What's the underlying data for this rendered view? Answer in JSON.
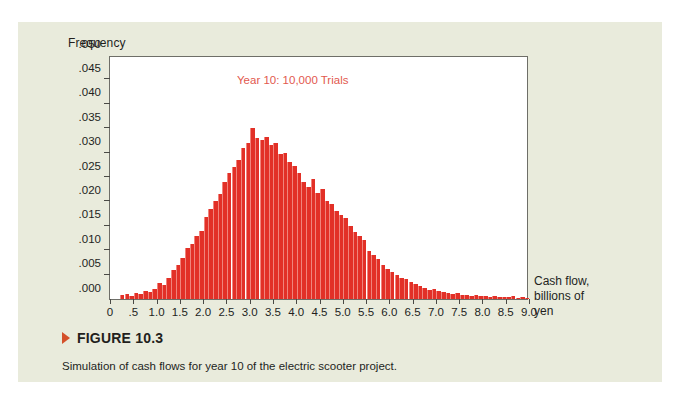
{
  "figure": {
    "marker_icon": "triangle-marker-icon",
    "number_label": "FIGURE 10.3",
    "caption": "Simulation of cash flows for year 10 of the electric scooter project."
  },
  "colors": {
    "panel_background": "#e9ebdc",
    "plot_background": "#ffffff",
    "bar": "#e23027",
    "annotation": "#e2594e",
    "marker": "#d4502a",
    "axis": "#6e6e68",
    "text": "#231f1d"
  },
  "chart_data": {
    "type": "bar",
    "title": "",
    "annotation": "Year 10: 10,000 Trials",
    "ylabel": "Frequency",
    "xlabel": "Cash flow, billions of yen",
    "xlabel_lines": [
      "Cash flow,",
      "billions of",
      "yen"
    ],
    "ylim": [
      0.0,
      0.05
    ],
    "xlim": [
      0.0,
      9.0
    ],
    "grid": false,
    "legend": "none",
    "ytick_labels": [
      ".000",
      ".005",
      ".010",
      ".015",
      ".020",
      ".025",
      ".030",
      ".035",
      ".040",
      ".045",
      ".050"
    ],
    "ytick_values": [
      0.0,
      0.005,
      0.01,
      0.015,
      0.02,
      0.025,
      0.03,
      0.035,
      0.04,
      0.045,
      0.05
    ],
    "xtick_labels": [
      "0",
      ".5",
      "1.0",
      "1.5",
      "2.0",
      "2.5",
      "3.0",
      "3.5",
      "4.0",
      "4.5",
      "5.0",
      "5.5",
      "6.0",
      "6.5",
      "7.0",
      "7.5",
      "8.0",
      "8.5",
      "9.0"
    ],
    "xtick_values": [
      0.0,
      0.5,
      1.0,
      1.5,
      2.0,
      2.5,
      3.0,
      3.5,
      4.0,
      4.5,
      5.0,
      5.5,
      6.0,
      6.5,
      7.0,
      7.5,
      8.0,
      8.5,
      9.0
    ],
    "bin_width": 0.1,
    "x": [
      0.05,
      0.15,
      0.25,
      0.35,
      0.45,
      0.55,
      0.65,
      0.75,
      0.85,
      0.95,
      1.05,
      1.15,
      1.25,
      1.35,
      1.45,
      1.55,
      1.65,
      1.75,
      1.85,
      1.95,
      2.05,
      2.15,
      2.25,
      2.35,
      2.45,
      2.55,
      2.65,
      2.75,
      2.85,
      2.95,
      3.05,
      3.15,
      3.25,
      3.35,
      3.45,
      3.55,
      3.65,
      3.75,
      3.85,
      3.95,
      4.05,
      4.15,
      4.25,
      4.35,
      4.45,
      4.55,
      4.65,
      4.75,
      4.85,
      4.95,
      5.05,
      5.15,
      5.25,
      5.35,
      5.45,
      5.55,
      5.65,
      5.75,
      5.85,
      5.95,
      6.05,
      6.15,
      6.25,
      6.35,
      6.45,
      6.55,
      6.65,
      6.75,
      6.85,
      6.95,
      7.05,
      7.15,
      7.25,
      7.35,
      7.45,
      7.55,
      7.65,
      7.75,
      7.85,
      7.95,
      8.05,
      8.15,
      8.25,
      8.35,
      8.45,
      8.55,
      8.65,
      8.75,
      8.85,
      8.95
    ],
    "values": [
      0.0,
      0.0,
      0.0008,
      0.001,
      0.0006,
      0.0013,
      0.0011,
      0.0016,
      0.0014,
      0.002,
      0.0032,
      0.0028,
      0.0044,
      0.006,
      0.007,
      0.0085,
      0.0105,
      0.0112,
      0.013,
      0.014,
      0.0168,
      0.0185,
      0.02,
      0.0215,
      0.024,
      0.0258,
      0.027,
      0.0285,
      0.031,
      0.032,
      0.035,
      0.033,
      0.0325,
      0.0332,
      0.0315,
      0.032,
      0.0298,
      0.03,
      0.028,
      0.0272,
      0.0258,
      0.024,
      0.023,
      0.0245,
      0.0218,
      0.0225,
      0.02,
      0.0195,
      0.018,
      0.0172,
      0.0165,
      0.015,
      0.0138,
      0.013,
      0.012,
      0.0098,
      0.009,
      0.0082,
      0.007,
      0.0062,
      0.0055,
      0.005,
      0.0044,
      0.004,
      0.0035,
      0.003,
      0.0026,
      0.0022,
      0.0018,
      0.002,
      0.0016,
      0.0014,
      0.0012,
      0.001,
      0.0012,
      0.0008,
      0.0009,
      0.0007,
      0.0008,
      0.0006,
      0.0007,
      0.0005,
      0.0006,
      0.0004,
      0.0005,
      0.0004,
      0.0006,
      0.0003,
      0.0004,
      0.0002
    ]
  }
}
